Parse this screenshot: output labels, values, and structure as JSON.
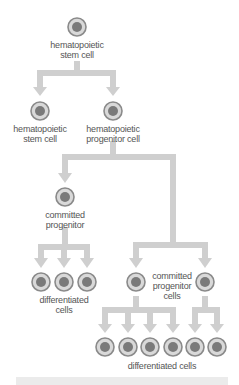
{
  "colors": {
    "connector": "#cfcfcf",
    "cell_ring": "#8a8a8a",
    "cell_fill": "#d9d9d9",
    "nucleus": "#7a7a7a",
    "text": "#555555",
    "band": "#ebebeb"
  },
  "labels": {
    "root": "hematopoietic\nstem cell",
    "self_renew": "hematopoietic\nstem cell",
    "progenitor": "hematopoietic\nprogenitor cell",
    "committed_left": "committed\nprogenitor",
    "diff_left": "differentiated\ncells",
    "committed_right": "committed\nprogenitor\ncells",
    "diff_bottom": "differentiated cells"
  },
  "cells": [
    {
      "id": "root",
      "x": 77,
      "y": 27
    },
    {
      "id": "self_renew",
      "x": 40,
      "y": 111
    },
    {
      "id": "progenitor",
      "x": 113,
      "y": 111
    },
    {
      "id": "committed_left",
      "x": 65,
      "y": 197
    },
    {
      "id": "diff_l1",
      "x": 41,
      "y": 282
    },
    {
      "id": "diff_l2",
      "x": 64,
      "y": 282
    },
    {
      "id": "diff_l3",
      "x": 87,
      "y": 282
    },
    {
      "id": "committed_r1",
      "x": 136,
      "y": 282
    },
    {
      "id": "committed_r2",
      "x": 205,
      "y": 282
    },
    {
      "id": "diff_b1",
      "x": 105,
      "y": 347
    },
    {
      "id": "diff_b2",
      "x": 128,
      "y": 347
    },
    {
      "id": "diff_b3",
      "x": 150,
      "y": 347
    },
    {
      "id": "diff_b4",
      "x": 173,
      "y": 347
    },
    {
      "id": "diff_b5",
      "x": 195,
      "y": 347
    },
    {
      "id": "diff_b6",
      "x": 217,
      "y": 347
    }
  ]
}
